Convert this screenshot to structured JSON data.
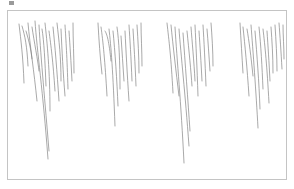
{
  "image": {
    "description": "Pencil sketch of four clusters of hanging vertical strokes, resembling icicles",
    "stroke_color": "#6f6f6f",
    "frame_border_color": "#c4c4c4",
    "background_color": "#ffffff",
    "clusters": [
      {
        "name": "cluster-1",
        "left": 18,
        "right": 74,
        "deepest_tip_y": 158
      },
      {
        "name": "cluster-2",
        "left": 96,
        "right": 141,
        "deepest_tip_y": 125
      },
      {
        "name": "cluster-3",
        "left": 165,
        "right": 213,
        "deepest_tip_y": 162
      },
      {
        "name": "cluster-4",
        "left": 238,
        "right": 283,
        "deepest_tip_y": 127
      }
    ]
  },
  "icons": {
    "corner": "image-icon"
  }
}
